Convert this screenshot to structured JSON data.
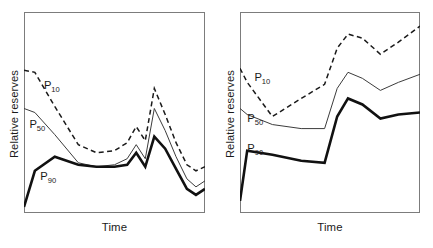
{
  "figure": {
    "background_color": "#ffffff",
    "frame_color": "#7c7c7c",
    "ink_color": "#1a1a1a"
  },
  "chart_data": {
    "type": "line",
    "title": "",
    "subtitle": "",
    "panels": [
      {
        "name": "left-panel",
        "xlabel": "Time",
        "ylabel": "Relative reserves",
        "xlim": [
          0,
          100
        ],
        "ylim": [
          0,
          100
        ],
        "grid": false,
        "legend_position": "inline-annotations",
        "axis_ticks": false,
        "tick_labels_x": [],
        "tick_labels_y": [],
        "annotations": [
          {
            "text": "P10",
            "base": "P",
            "sub": "10",
            "x": 11,
            "y": 66
          },
          {
            "text": "P50",
            "base": "P",
            "sub": "50",
            "x": 3,
            "y": 47
          },
          {
            "text": "P90",
            "base": "P",
            "sub": "90",
            "x": 9,
            "y": 21
          }
        ],
        "series": [
          {
            "name": "P10",
            "style": "dashed",
            "color": "#1a1a1a",
            "width": 1.5,
            "x": [
              0,
              6,
              17,
              30,
              40,
              50,
              57,
              62,
              67,
              72,
              78,
              84,
              90,
              95,
              100
            ],
            "values": [
              71,
              70,
              53,
              34,
              30,
              31,
              35,
              43,
              36,
              62,
              49,
              35,
              24,
              21,
              23
            ]
          },
          {
            "name": "P50",
            "style": "solid",
            "color": "#3c3c3c",
            "width": 1.0,
            "x": [
              0,
              6,
              17,
              30,
              40,
              50,
              57,
              62,
              67,
              72,
              78,
              84,
              90,
              95,
              100
            ],
            "values": [
              52,
              50,
              39,
              25,
              23,
              24,
              27,
              34,
              27,
              52,
              41,
              28,
              17,
              13,
              16
            ]
          },
          {
            "name": "P90",
            "style": "solid",
            "color": "#111111",
            "width": 2.6,
            "x": [
              0,
              6,
              17,
              30,
              40,
              50,
              57,
              62,
              67,
              72,
              78,
              84,
              90,
              95,
              100
            ],
            "values": [
              3,
              21,
              28,
              24,
              23,
              23,
              24,
              30,
              23,
              38,
              32,
              22,
              12,
              9,
              12
            ]
          }
        ]
      },
      {
        "name": "right-panel",
        "xlabel": "Time",
        "ylabel": "Relative reserves",
        "xlim": [
          0,
          100
        ],
        "ylim": [
          0,
          100
        ],
        "grid": false,
        "legend_position": "inline-annotations",
        "axis_ticks": false,
        "tick_labels_x": [],
        "tick_labels_y": [],
        "annotations": [
          {
            "text": "P10",
            "base": "P",
            "sub": "10",
            "x": 8,
            "y": 70
          },
          {
            "text": "P50",
            "base": "P",
            "sub": "50",
            "x": 4,
            "y": 50
          },
          {
            "text": "P90",
            "base": "P",
            "sub": "90",
            "x": 4,
            "y": 35
          }
        ],
        "series": [
          {
            "name": "P10",
            "style": "dashed",
            "color": "#1a1a1a",
            "width": 1.5,
            "x": [
              0,
              4,
              18,
              34,
              47,
              54,
              60,
              68,
              78,
              88,
              100
            ],
            "values": [
              72,
              65,
              48,
              57,
              64,
              82,
              89,
              87,
              79,
              85,
              93
            ]
          },
          {
            "name": "P50",
            "style": "solid",
            "color": "#3c3c3c",
            "width": 1.0,
            "x": [
              0,
              4,
              18,
              34,
              47,
              54,
              60,
              68,
              78,
              88,
              100
            ],
            "values": [
              52,
              49,
              44,
              42,
              42,
              62,
              70,
              67,
              61,
              65,
              69
            ]
          },
          {
            "name": "P90",
            "style": "solid",
            "color": "#111111",
            "width": 2.6,
            "x": [
              0,
              4,
              18,
              34,
              47,
              54,
              60,
              68,
              78,
              88,
              100
            ],
            "values": [
              6,
              31,
              29,
              26,
              25,
              48,
              57,
              54,
              47,
              49,
              50
            ]
          }
        ]
      }
    ]
  }
}
